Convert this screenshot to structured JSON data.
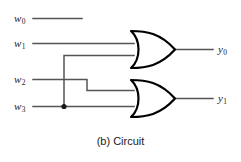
{
  "figure": {
    "caption": "(b) Circuit",
    "background_color": "#ffffff",
    "wire_color": "#555555",
    "gate_color": "#000000"
  },
  "inputs": [
    {
      "name": "w0",
      "label": "w",
      "subscript": "0"
    },
    {
      "name": "w1",
      "label": "w",
      "subscript": "1"
    },
    {
      "name": "w2",
      "label": "w",
      "subscript": "2"
    },
    {
      "name": "w3",
      "label": "w",
      "subscript": "3"
    }
  ],
  "outputs": [
    {
      "name": "y0",
      "label": "y",
      "subscript": "0"
    },
    {
      "name": "y1",
      "label": "y",
      "subscript": "1"
    }
  ],
  "gates": [
    {
      "name": "or-gate-top",
      "type": "OR",
      "output": "y0"
    },
    {
      "name": "or-gate-bottom",
      "type": "OR",
      "output": "y1"
    }
  ]
}
